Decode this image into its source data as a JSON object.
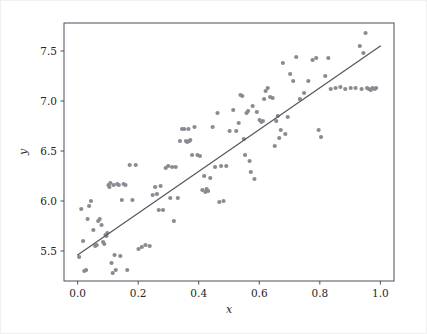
{
  "figure": {
    "background_color": "#ffffff",
    "border_color": "#f0f0f0",
    "width": 427,
    "height": 334
  },
  "axes": {
    "frame_color": "#4d4d5c",
    "left": 63,
    "top": 22,
    "right": 393,
    "bottom": 280
  },
  "chart_data": {
    "type": "scatter",
    "title": "",
    "xlabel": "x",
    "ylabel": "y",
    "xlim": [
      -0.045,
      1.045
    ],
    "ylim": [
      5.2,
      7.78
    ],
    "grid": false,
    "legend": null,
    "point_color": "#8a8a92",
    "line_color": "#57575f",
    "marker_size": 2.1,
    "xticks": [
      0.0,
      0.2,
      0.4,
      0.6,
      0.8,
      1.0
    ],
    "xtick_labels": [
      "0.0",
      "0.2",
      "0.4",
      "0.6",
      "0.8",
      "1.0"
    ],
    "yticks": [
      5.5,
      6.0,
      6.5,
      7.0,
      7.5
    ],
    "ytick_labels": [
      "5.5",
      "6.0",
      "6.5",
      "7.0",
      "7.5"
    ],
    "fit_line": {
      "x": [
        0.0,
        1.0
      ],
      "y": [
        5.46,
        7.55
      ],
      "slope": 2.09,
      "intercept": 5.46
    },
    "series": [
      {
        "name": "observations",
        "n_points": 120,
        "x": [
          0.005,
          0.012,
          0.018,
          0.022,
          0.028,
          0.033,
          0.038,
          0.044,
          0.052,
          0.058,
          0.063,
          0.068,
          0.073,
          0.079,
          0.084,
          0.088,
          0.092,
          0.095,
          0.098,
          0.102,
          0.105,
          0.108,
          0.112,
          0.116,
          0.119,
          0.122,
          0.126,
          0.131,
          0.136,
          0.141,
          0.146,
          0.152,
          0.158,
          0.164,
          0.172,
          0.181,
          0.192,
          0.201,
          0.212,
          0.224,
          0.238,
          0.248,
          0.256,
          0.262,
          0.268,
          0.274,
          0.282,
          0.291,
          0.299,
          0.306,
          0.312,
          0.318,
          0.324,
          0.331,
          0.338,
          0.345,
          0.352,
          0.358,
          0.362,
          0.366,
          0.369,
          0.372,
          0.378,
          0.386,
          0.396,
          0.404,
          0.412,
          0.418,
          0.422,
          0.426,
          0.431,
          0.438,
          0.446,
          0.454,
          0.462,
          0.468,
          0.474,
          0.482,
          0.491,
          0.502,
          0.514,
          0.524,
          0.532,
          0.538,
          0.544,
          0.549,
          0.553,
          0.558,
          0.563,
          0.568,
          0.572,
          0.578,
          0.584,
          0.592,
          0.601,
          0.607,
          0.612,
          0.616,
          0.621,
          0.628,
          0.636,
          0.644,
          0.651,
          0.656,
          0.661,
          0.666,
          0.671,
          0.678,
          0.686,
          0.694,
          0.702,
          0.712,
          0.722,
          0.734,
          0.748,
          0.762,
          0.776,
          0.788,
          0.796,
          0.804,
          0.818,
          0.828,
          0.836,
          0.852,
          0.868,
          0.884,
          0.902,
          0.918,
          0.932,
          0.938,
          0.944,
          0.951,
          0.956,
          0.962,
          0.968,
          0.974,
          0.981,
          0.986
        ],
        "y": [
          5.44,
          5.92,
          5.6,
          5.3,
          5.31,
          5.82,
          5.95,
          6.0,
          5.71,
          5.55,
          5.56,
          5.8,
          5.82,
          5.76,
          5.59,
          5.57,
          5.66,
          5.65,
          5.68,
          6.16,
          6.14,
          6.18,
          5.38,
          5.28,
          6.16,
          5.46,
          5.31,
          6.17,
          6.16,
          5.45,
          6.01,
          6.17,
          6.16,
          5.31,
          6.36,
          6.01,
          6.36,
          5.52,
          5.54,
          5.56,
          5.55,
          6.06,
          6.14,
          6.07,
          5.91,
          6.15,
          5.91,
          6.33,
          6.35,
          6.03,
          6.34,
          5.8,
          6.34,
          6.03,
          6.6,
          6.72,
          6.72,
          6.6,
          6.59,
          6.72,
          6.6,
          6.61,
          6.46,
          6.74,
          6.46,
          6.45,
          6.11,
          6.25,
          6.09,
          6.12,
          6.1,
          6.23,
          6.74,
          6.34,
          6.88,
          5.99,
          6.35,
          6.0,
          6.35,
          6.7,
          6.91,
          6.7,
          6.78,
          7.06,
          7.05,
          6.62,
          6.46,
          6.88,
          6.9,
          6.4,
          6.29,
          6.95,
          6.22,
          6.89,
          6.81,
          6.79,
          6.8,
          7.02,
          7.1,
          7.13,
          7.04,
          7.03,
          6.55,
          6.8,
          6.85,
          6.63,
          6.71,
          7.38,
          6.67,
          6.84,
          7.27,
          7.2,
          7.44,
          7.02,
          7.08,
          7.2,
          7.41,
          7.43,
          6.71,
          6.64,
          7.25,
          7.43,
          7.12,
          7.13,
          7.14,
          7.12,
          7.13,
          7.13,
          7.55,
          7.12,
          7.48,
          7.68,
          7.13,
          7.12,
          7.11,
          7.13,
          7.12,
          7.13
        ]
      }
    ]
  }
}
